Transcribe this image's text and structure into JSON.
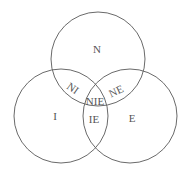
{
  "diagram": {
    "type": "venn",
    "sets": [
      {
        "id": "N",
        "label": "N"
      },
      {
        "id": "I",
        "label": "I"
      },
      {
        "id": "E",
        "label": "E"
      }
    ],
    "regions": {
      "N": "N",
      "I": "I",
      "E": "E",
      "NI": "NI",
      "NE": "NE",
      "IE": "IE",
      "NIE": "NIE"
    },
    "colors": {
      "stroke": "#6a6a6a",
      "text": "#555555",
      "background": "#ffffff"
    }
  }
}
